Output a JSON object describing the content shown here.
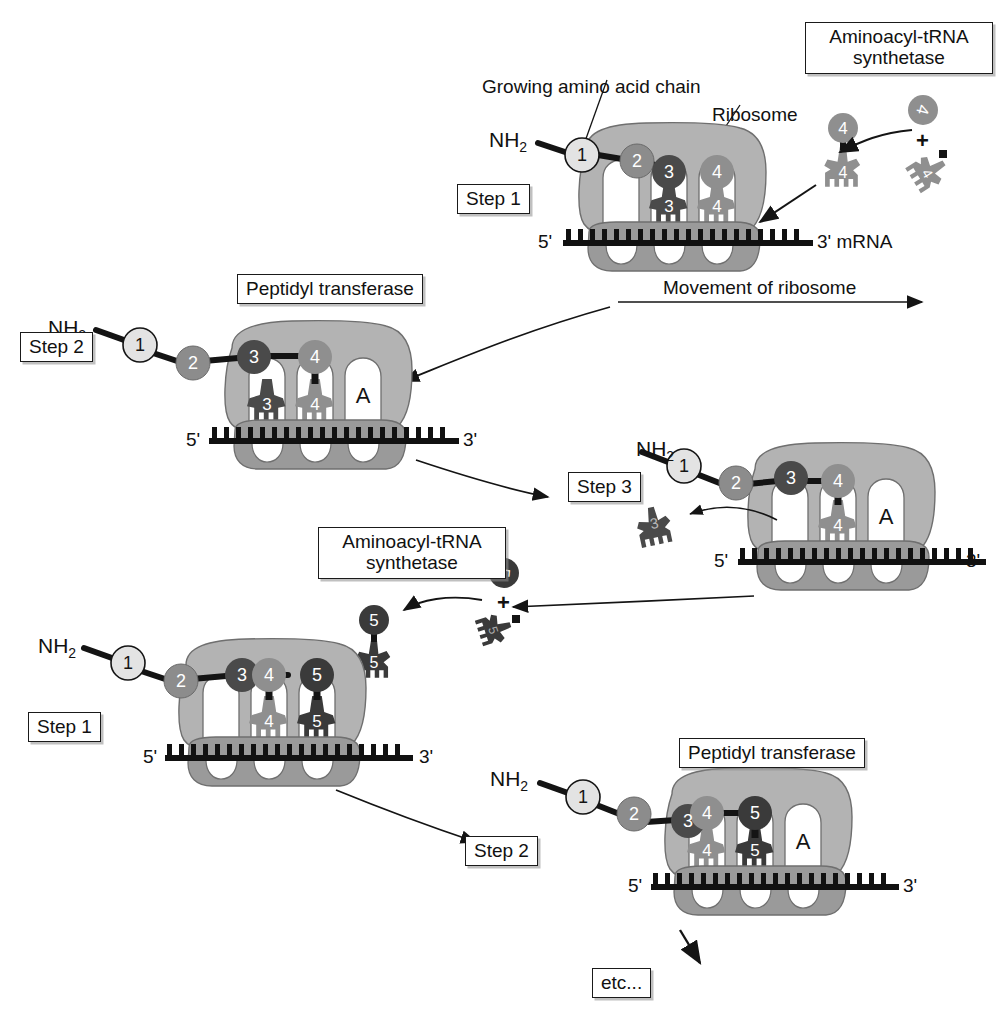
{
  "diagram": {
    "colors": {
      "background": "#ffffff",
      "ink": "#141414",
      "ribosome_large": "#b3b3b3",
      "ribosome_small": "#9a9a9a",
      "tunnel": "#ffffff",
      "mrna": "#111111",
      "aa1": "#e3e3e3",
      "aa2": "#8c8c8c",
      "aa3": "#4a4a4a",
      "aa4": "#8f8f8f",
      "aa5": "#3a3a3a",
      "trna3": "#4a4a4a",
      "trna4": "#8f8f8f",
      "trna5": "#3a3a3a"
    }
  },
  "labels": {
    "growing_chain": "Growing amino acid chain",
    "ribosome": "Ribosome",
    "movement": "Movement of ribosome",
    "mrna_tag": "3' mRNA",
    "five_prime": "5'",
    "three_prime": "3'",
    "nh2": "NH",
    "nh2_sub": "2",
    "a_site": "A",
    "plus": "+",
    "etc": "etc...",
    "aminoacyl_line1": "Aminoacyl-tRNA",
    "aminoacyl_line2": "synthetase",
    "peptidyl": "Peptidyl transferase",
    "step1": "Step 1",
    "step2": "Step 2",
    "step3": "Step 3"
  },
  "panels": [
    {
      "id": "panel-top-step1",
      "step_label": "Step 1",
      "callout_box": "Aminoacyl-tRNA\nsynthetase",
      "chain": [
        "1",
        "2",
        "3",
        "4"
      ],
      "trna_in_ribosome": [
        "3",
        "4"
      ],
      "free_trna_charged": "4",
      "free_amino_acid": "4",
      "free_trna_uncharged": "4",
      "a_site_shown": false,
      "ends": {
        "left": "5'",
        "right": "3' mRNA"
      }
    },
    {
      "id": "panel-step2-upper",
      "step_label": "Step 2",
      "callout_box": "Peptidyl transferase",
      "chain": [
        "1",
        "2",
        "3",
        "4"
      ],
      "trna_in_ribosome": [
        "3",
        "4"
      ],
      "a_site_shown": true,
      "ends": {
        "left": "5'",
        "right": "3'"
      }
    },
    {
      "id": "panel-step3",
      "step_label": "Step 3",
      "chain": [
        "1",
        "2",
        "3",
        "4"
      ],
      "trna_in_ribosome": [
        "4"
      ],
      "released_trna": "3",
      "a_site_shown": true,
      "ends": {
        "left": "5'",
        "right": "3'"
      }
    },
    {
      "id": "panel-step1-lower",
      "step_label": "Step 1",
      "callout_box": "Aminoacyl-tRNA\nsynthetase",
      "chain": [
        "1",
        "2",
        "3",
        "4",
        "5"
      ],
      "trna_in_ribosome": [
        "4",
        "5"
      ],
      "free_trna_charged": "5",
      "free_amino_acid": "5",
      "free_trna_uncharged": "5",
      "a_site_shown": false,
      "ends": {
        "left": "5'",
        "right": "3'"
      }
    },
    {
      "id": "panel-step2-lower",
      "step_label": "Step 2",
      "callout_box": "Peptidyl transferase",
      "chain": [
        "1",
        "2",
        "3",
        "4",
        "5"
      ],
      "trna_in_ribosome": [
        "4",
        "5"
      ],
      "a_site_shown": true,
      "ends": {
        "left": "5'",
        "right": "3'"
      },
      "next": "etc..."
    }
  ],
  "text": {
    "t_growing": "Growing amino acid chain",
    "t_ribosome": "Ribosome",
    "t_movement": "Movement of ribosome",
    "t_mrna": "3' mRNA",
    "t_etc": "etc...",
    "t_amino1": "Aminoacyl-tRNA",
    "t_amino2": "synthetase",
    "t_pept": "Peptidyl transferase",
    "t_step1": "Step 1",
    "t_step2": "Step 2",
    "t_step3": "Step 3",
    "t_five": "5'",
    "t_three": "3'",
    "t_A": "A",
    "t_plus": "+",
    "n1": "1",
    "n2": "2",
    "n3": "3",
    "n4": "4",
    "n5": "5"
  }
}
